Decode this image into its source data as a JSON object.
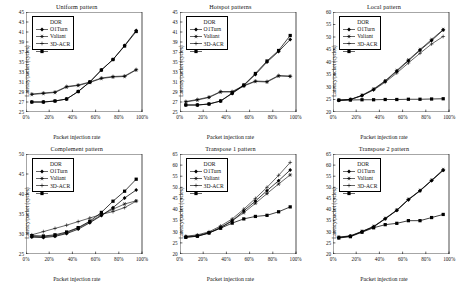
{
  "figure": {
    "series_names": [
      "DOR",
      "O1Turn",
      "Valiant",
      "3D-ACR"
    ],
    "xlabel": "Packet injection rate",
    "ylabel": "Latency/packet (cycles)",
    "xticklabels": [
      "0%",
      "20%",
      "40%",
      "60%",
      "80%",
      "100%"
    ]
  },
  "chart_data": [
    {
      "type": "line",
      "title": "Uniform pattern",
      "xlabel": "Packet injection rate",
      "ylabel": "Latency/packet (cycles)",
      "x": [
        5,
        15,
        25,
        35,
        45,
        55,
        65,
        75,
        85,
        95
      ],
      "xlim": [
        0,
        100
      ],
      "ylim": [
        25,
        45
      ],
      "yticks": [
        25,
        27,
        29,
        31,
        33,
        35,
        37,
        39,
        41,
        43,
        45
      ],
      "xticks": [
        0,
        20,
        40,
        60,
        80,
        100
      ],
      "grid": false,
      "legend_position": "upper-left",
      "series": [
        {
          "name": "DOR",
          "values": [
            27.0,
            27.0,
            27.2,
            27.6,
            29.1,
            31.0,
            33.4,
            35.5,
            38.3,
            41.3
          ]
        },
        {
          "name": "O1Turn",
          "values": [
            28.5,
            28.7,
            28.9,
            30.0,
            30.3,
            30.9,
            31.7,
            32.0,
            32.1,
            33.4
          ]
        },
        {
          "name": "Valiant",
          "values": [
            28.6,
            28.8,
            29.0,
            30.1,
            30.4,
            31.0,
            31.8,
            32.1,
            32.2,
            33.5
          ]
        },
        {
          "name": "3D-ACR",
          "values": [
            27.0,
            27.0,
            27.2,
            27.6,
            29.1,
            31.0,
            33.4,
            35.5,
            38.2,
            41.1
          ]
        }
      ]
    },
    {
      "type": "line",
      "title": "Hotspot patterns",
      "xlabel": "Packet injection rate",
      "ylabel": "Latency/packet (cycles)",
      "x": [
        5,
        15,
        25,
        35,
        45,
        55,
        65,
        75,
        85,
        95
      ],
      "xlim": [
        0,
        100
      ],
      "ylim": [
        25,
        45
      ],
      "yticks": [
        25,
        27,
        29,
        31,
        33,
        35,
        37,
        39,
        41,
        43,
        45
      ],
      "xticks": [
        0,
        20,
        40,
        60,
        80,
        100
      ],
      "grid": false,
      "legend_position": "upper-left",
      "series": [
        {
          "name": "DOR",
          "values": [
            26.4,
            26.4,
            26.6,
            27.2,
            28.7,
            30.3,
            32.5,
            35.0,
            37.1,
            39.5
          ]
        },
        {
          "name": "O1Turn",
          "values": [
            27.0,
            27.4,
            27.9,
            29.0,
            29.0,
            30.2,
            31.1,
            31.0,
            32.2,
            32.1
          ]
        },
        {
          "name": "Valiant",
          "values": [
            27.1,
            27.5,
            28.0,
            29.1,
            29.1,
            30.3,
            31.2,
            31.1,
            32.3,
            32.2
          ]
        },
        {
          "name": "3D-ACR",
          "values": [
            26.4,
            26.4,
            26.6,
            27.2,
            28.8,
            30.4,
            32.7,
            35.2,
            37.3,
            40.3
          ]
        }
      ]
    },
    {
      "type": "line",
      "title": "Local pattern",
      "xlabel": "Packet injection rate",
      "ylabel": "Latency/packet (cycles)",
      "x": [
        5,
        15,
        25,
        35,
        45,
        55,
        65,
        75,
        85,
        95
      ],
      "xlim": [
        0,
        100
      ],
      "ylim": [
        20,
        60
      ],
      "yticks": [
        20,
        25,
        30,
        35,
        40,
        45,
        50,
        55,
        60
      ],
      "xticks": [
        0,
        20,
        40,
        60,
        80,
        100
      ],
      "grid": false,
      "legend_position": "upper-left",
      "series": [
        {
          "name": "DOR",
          "values": [
            24.7,
            25.0,
            26.6,
            29.0,
            32.3,
            36.3,
            40.5,
            44.7,
            48.6,
            52.8
          ]
        },
        {
          "name": "O1Turn",
          "values": [
            24.7,
            25.0,
            26.7,
            29.2,
            32.5,
            36.6,
            40.8,
            45.0,
            49.0,
            53.0
          ]
        },
        {
          "name": "Valiant",
          "values": [
            24.7,
            25.0,
            26.5,
            28.8,
            31.9,
            35.6,
            39.6,
            43.5,
            47.2,
            50.2
          ]
        },
        {
          "name": "3D-ACR",
          "values": [
            24.7,
            24.8,
            24.9,
            24.9,
            25.0,
            25.0,
            25.1,
            25.1,
            25.2,
            25.3
          ]
        }
      ]
    },
    {
      "type": "line",
      "title": "Complement pattern",
      "xlabel": "Packet injection rate",
      "ylabel": "Latency/packet (cycles)",
      "x": [
        5,
        15,
        25,
        35,
        45,
        55,
        65,
        75,
        85,
        95
      ],
      "xlim": [
        0,
        100
      ],
      "ylim": [
        25,
        50
      ],
      "yticks": [
        25,
        30,
        35,
        40,
        45,
        50
      ],
      "xticks": [
        0,
        20,
        40,
        60,
        80,
        100
      ],
      "grid": false,
      "legend_position": "upper-left",
      "series": [
        {
          "name": "DOR",
          "values": [
            29.2,
            29.1,
            29.4,
            30.1,
            31.2,
            32.8,
            34.6,
            36.6,
            39.0,
            41.0
          ]
        },
        {
          "name": "O1Turn",
          "values": [
            29.4,
            29.3,
            29.6,
            30.3,
            31.5,
            33.0,
            34.8,
            36.2,
            37.5,
            38.3
          ]
        },
        {
          "name": "Valiant",
          "values": [
            29.8,
            30.6,
            31.4,
            32.2,
            33.1,
            34.0,
            34.9,
            35.6,
            36.6,
            38.2
          ]
        },
        {
          "name": "3D-ACR",
          "values": [
            29.6,
            29.5,
            29.8,
            30.5,
            31.6,
            33.2,
            35.4,
            38.2,
            40.7,
            43.7
          ]
        }
      ]
    },
    {
      "type": "line",
      "title": "Transpose 1 pattern",
      "xlabel": "Packet injection rate",
      "ylabel": "Latency/packet (cycles)",
      "x": [
        5,
        15,
        25,
        35,
        45,
        55,
        65,
        75,
        85,
        95
      ],
      "xlim": [
        0,
        100
      ],
      "ylim": [
        20,
        65
      ],
      "yticks": [
        20,
        25,
        30,
        35,
        40,
        45,
        50,
        55,
        60,
        65
      ],
      "xticks": [
        0,
        20,
        40,
        60,
        80,
        100
      ],
      "grid": false,
      "legend_position": "upper-left",
      "series": [
        {
          "name": "DOR",
          "values": [
            27.6,
            28.0,
            29.4,
            31.8,
            34.9,
            39.4,
            43.8,
            48.5,
            53.0,
            57.8
          ]
        },
        {
          "name": "O1Turn",
          "values": [
            27.8,
            28.3,
            29.6,
            32.0,
            35.0,
            38.6,
            42.8,
            47.2,
            51.5,
            55.6
          ]
        },
        {
          "name": "Valiant",
          "values": [
            28.0,
            28.6,
            30.0,
            32.6,
            35.8,
            40.2,
            45.0,
            50.0,
            55.4,
            61.2
          ]
        },
        {
          "name": "3D-ACR",
          "values": [
            27.5,
            28.0,
            29.5,
            31.6,
            33.9,
            35.8,
            36.9,
            37.4,
            39.0,
            41.2
          ]
        }
      ]
    },
    {
      "type": "line",
      "title": "Transpose 2 pattern",
      "xlabel": "Packet injection rate",
      "ylabel": "Latency/packet (cycles)",
      "x": [
        5,
        15,
        25,
        35,
        45,
        55,
        65,
        75,
        85,
        95
      ],
      "xlim": [
        0,
        100
      ],
      "ylim": [
        20,
        65
      ],
      "yticks": [
        20,
        25,
        30,
        35,
        40,
        45,
        50,
        55,
        60,
        65
      ],
      "xticks": [
        0,
        20,
        40,
        60,
        80,
        100
      ],
      "grid": false,
      "legend_position": "upper-left",
      "series": [
        {
          "name": "DOR",
          "values": [
            27.4,
            28.0,
            30.0,
            32.2,
            35.8,
            39.6,
            44.4,
            48.4,
            53.0,
            57.6
          ]
        },
        {
          "name": "O1Turn",
          "values": [
            27.6,
            28.2,
            30.2,
            32.4,
            36.0,
            39.8,
            44.6,
            48.6,
            53.2,
            58.0
          ]
        },
        {
          "name": "Valiant",
          "values": [
            27.5,
            28.1,
            30.1,
            32.3,
            35.9,
            39.7,
            44.5,
            48.5,
            53.1,
            57.8
          ]
        },
        {
          "name": "3D-ACR",
          "values": [
            27.2,
            27.8,
            29.8,
            31.8,
            33.2,
            33.8,
            35.0,
            35.0,
            36.4,
            37.8
          ]
        }
      ]
    }
  ]
}
